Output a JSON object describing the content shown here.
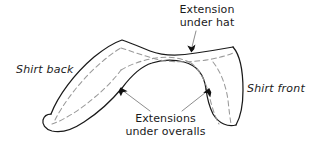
{
  "diagram": {
    "type": "technical-line-drawing",
    "colors": {
      "outline": "#1a1a1a",
      "dashed_interior": "#9a9a9a",
      "leader_line": "#8d8d8d",
      "text": "#1b1b1b",
      "background": "#ffffff"
    },
    "labels": {
      "extension_under_hat": "Extension\nunder hat",
      "extensions_under_overalls": "Extensions\nunder overalls",
      "shirt_back": "Shirt back",
      "shirt_front": "Shirt front"
    },
    "callouts": [
      {
        "name": "extension-under-hat",
        "text": "Extension under hat",
        "arrowhead": {
          "x": 191,
          "y": 51
        },
        "leader_from": {
          "x": 196,
          "y": 30
        }
      },
      {
        "name": "extensions-under-overalls-left",
        "text": "Extensions under overalls",
        "arrowhead": {
          "x": 121,
          "y": 89
        },
        "leader_from": {
          "x": 150,
          "y": 112
        }
      },
      {
        "name": "extensions-under-overalls-right",
        "text": "Extensions under overalls",
        "arrowhead": {
          "x": 208,
          "y": 90
        },
        "leader_from": {
          "x": 182,
          "y": 112
        }
      }
    ]
  }
}
